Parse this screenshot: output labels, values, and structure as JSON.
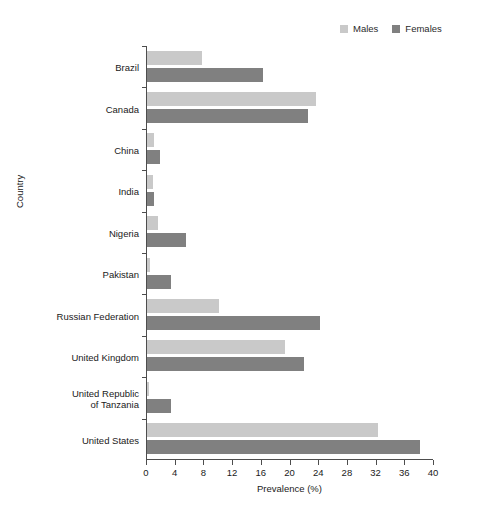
{
  "chart_data": {
    "type": "bar",
    "orientation": "horizontal",
    "title": "",
    "xlabel": "Prevalence (%)",
    "ylabel": "Country",
    "xlim": [
      0,
      40
    ],
    "xticks": [
      0,
      4,
      8,
      12,
      16,
      20,
      24,
      28,
      32,
      36,
      40
    ],
    "grid": false,
    "legend_position": "top-right",
    "categories": [
      "Brazil",
      "Canada",
      "China",
      "India",
      "Nigeria",
      "Pakistan",
      "Russian Federation",
      "United Kingdom",
      "United Republic\nof Tanzania",
      "United States"
    ],
    "series": [
      {
        "name": "Males",
        "color": "#c9c9c9",
        "values": [
          7.6,
          23.5,
          1.0,
          0.9,
          1.6,
          0.4,
          10.1,
          19.2,
          0.3,
          32.2
        ]
      },
      {
        "name": "Females",
        "color": "#808080",
        "values": [
          16.2,
          22.5,
          1.8,
          1.0,
          5.5,
          3.4,
          24.1,
          21.9,
          3.3,
          38.1
        ]
      }
    ]
  },
  "legend": {
    "entries": [
      {
        "label": "Males"
      },
      {
        "label": "Females"
      }
    ]
  },
  "colors": {
    "males": "#c9c9c9",
    "females": "#808080",
    "axis": "#4d4d4d",
    "text": "#1a1a1a",
    "background": "#ffffff"
  }
}
